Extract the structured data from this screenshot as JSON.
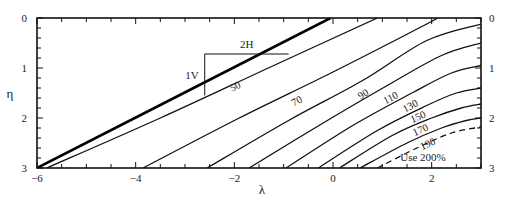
{
  "chart_data": {
    "type": "line",
    "title": "",
    "xlabel": "λ",
    "ylabel": "η",
    "xlim": [
      -6,
      3
    ],
    "ylim": [
      3,
      0
    ],
    "y_inverted": true,
    "grid": false,
    "x_ticks": [
      {
        "value": -6,
        "label": "−6"
      },
      {
        "value": -4,
        "label": "−4"
      },
      {
        "value": -2,
        "label": "−2"
      },
      {
        "value": 0,
        "label": "0"
      },
      {
        "value": 2,
        "label": "2"
      }
    ],
    "x_minor_step": 0.5,
    "y_ticks": [
      {
        "value": 0,
        "label": "0"
      },
      {
        "value": 1,
        "label": "1"
      },
      {
        "value": 2,
        "label": "2"
      },
      {
        "value": 3,
        "label": "3"
      }
    ],
    "y_minor_step": 0.2,
    "right_axis_ticks": [
      "0",
      "1",
      "2",
      "3"
    ],
    "slope_annotation": {
      "horizontal": "2H",
      "vertical": "1V",
      "triangle": {
        "x0": -2.6,
        "x1": -0.9,
        "y0": 0.72,
        "y1": 1.55
      }
    },
    "boundary_line": {
      "name": "2H:1V slope",
      "style": "thick",
      "points": [
        [
          -6,
          3
        ],
        [
          -0.05,
          0
        ]
      ]
    },
    "series": [
      {
        "name": "50",
        "label": "50",
        "label_pos": [
          -1.95,
          1.43
        ],
        "label_rot": -26,
        "points": [
          [
            -5.8,
            3
          ],
          [
            -3.5,
            2.0
          ],
          [
            -1.2,
            0.95
          ],
          [
            0.9,
            0
          ]
        ]
      },
      {
        "name": "70",
        "label": "70",
        "label_pos": [
          -0.7,
          1.72
        ],
        "label_rot": -28,
        "points": [
          [
            -3.85,
            3
          ],
          [
            -1.9,
            2.0
          ],
          [
            0.0,
            1.08
          ],
          [
            1.9,
            0.12
          ],
          [
            2.1,
            0
          ]
        ]
      },
      {
        "name": "90",
        "label": "90",
        "label_pos": [
          0.65,
          1.58
        ],
        "label_rot": -32,
        "points": [
          [
            -2.55,
            3
          ],
          [
            -0.9,
            2.05
          ],
          [
            0.6,
            1.25
          ],
          [
            1.9,
            0.45
          ],
          [
            3.0,
            0.12
          ]
        ]
      },
      {
        "name": "110",
        "label": "110",
        "label_pos": [
          1.2,
          1.66
        ],
        "label_rot": -28,
        "points": [
          [
            -1.7,
            3
          ],
          [
            -0.2,
            2.1
          ],
          [
            1.1,
            1.35
          ],
          [
            2.2,
            0.75
          ],
          [
            3.0,
            0.5
          ]
        ]
      },
      {
        "name": "130",
        "label": "130",
        "label_pos": [
          1.6,
          1.82
        ],
        "label_rot": -28,
        "points": [
          [
            -0.95,
            3
          ],
          [
            0.4,
            2.15
          ],
          [
            1.6,
            1.5
          ],
          [
            2.4,
            1.1
          ],
          [
            3.0,
            0.95
          ]
        ]
      },
      {
        "name": "150",
        "label": "150",
        "label_pos": [
          1.75,
          2.04
        ],
        "label_rot": -24,
        "points": [
          [
            -0.3,
            3
          ],
          [
            0.9,
            2.25
          ],
          [
            1.9,
            1.75
          ],
          [
            2.5,
            1.5
          ],
          [
            3.0,
            1.4
          ]
        ]
      },
      {
        "name": "170",
        "label": "170",
        "label_pos": [
          1.8,
          2.3
        ],
        "label_rot": -24,
        "points": [
          [
            0.13,
            3
          ],
          [
            1.2,
            2.35
          ],
          [
            2.0,
            2.0
          ],
          [
            2.6,
            1.8
          ],
          [
            3.0,
            1.72
          ]
        ]
      },
      {
        "name": "190",
        "label": "190",
        "label_pos": [
          1.95,
          2.58
        ],
        "label_rot": -24,
        "points": [
          [
            0.55,
            3
          ],
          [
            1.5,
            2.5
          ],
          [
            2.2,
            2.2
          ],
          [
            2.7,
            2.05
          ],
          [
            3.0,
            2.0
          ]
        ]
      },
      {
        "name": "200% limit",
        "style": "dashed",
        "label": "",
        "points": [
          [
            0.9,
            3
          ],
          [
            1.7,
            2.6
          ],
          [
            2.4,
            2.3
          ],
          [
            3.0,
            2.18
          ]
        ]
      }
    ],
    "annotations": [
      {
        "text": "Use 200%",
        "x": 1.9,
        "y": 2.75
      }
    ]
  }
}
